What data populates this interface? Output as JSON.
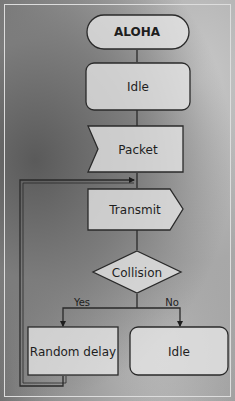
{
  "diagram": {
    "type": "flowchart",
    "title": "ALOHA",
    "nodes": [
      {
        "id": "start",
        "shape": "terminator",
        "label": "ALOHA"
      },
      {
        "id": "idle1",
        "shape": "rounded-rectangle",
        "label": "Idle"
      },
      {
        "id": "packet",
        "shape": "input-chevron",
        "label": "Packet"
      },
      {
        "id": "transmit",
        "shape": "output-pentagon",
        "label": "Transmit"
      },
      {
        "id": "collision",
        "shape": "decision-diamond",
        "label": "Collision"
      },
      {
        "id": "delay",
        "shape": "rectangle",
        "label": "Random delay"
      },
      {
        "id": "idle2",
        "shape": "rounded-rectangle",
        "label": "Idle"
      }
    ],
    "edges": [
      {
        "from": "start",
        "to": "idle1",
        "label": ""
      },
      {
        "from": "idle1",
        "to": "packet",
        "label": ""
      },
      {
        "from": "packet",
        "to": "transmit",
        "label": ""
      },
      {
        "from": "transmit",
        "to": "collision",
        "label": ""
      },
      {
        "from": "collision",
        "to": "delay",
        "label": "Yes"
      },
      {
        "from": "collision",
        "to": "idle2",
        "label": "No"
      },
      {
        "from": "delay",
        "to": "transmit",
        "label": ""
      }
    ],
    "branch_labels": {
      "yes": "Yes",
      "no": "No"
    },
    "colors": {
      "stroke": "#2a2a2a",
      "node_fill": "#e6e6e6",
      "background_dark": "#6e6e6e",
      "background_light": "#bdbdbd"
    }
  }
}
